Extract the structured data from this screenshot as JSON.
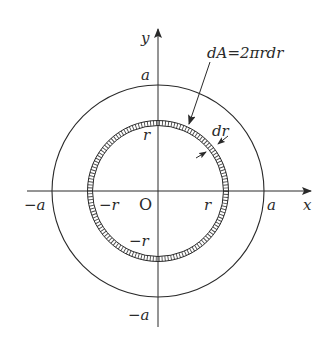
{
  "diagram": {
    "title": "",
    "type": "polar area element (thin annular ring) inside circle of radius a",
    "formula_label": "dA=2πrdr",
    "width_label": "dr",
    "axes": {
      "x_label": "x",
      "y_label": "y",
      "origin_label": "O"
    },
    "tick_labels": {
      "x_pos_a": "a",
      "x_neg_a": "−a",
      "x_pos_r": "r",
      "x_neg_r": "−r",
      "y_pos_a": "a",
      "y_neg_a": "−a",
      "y_pos_r": "r",
      "y_neg_r": "−r"
    },
    "shapes": {
      "outer_circle": {
        "label": "radius a"
      },
      "inner_ring": {
        "label": "annular strip of radius r and width dr"
      }
    },
    "colors": {
      "line": "#2a2a2a",
      "background": "#ffffff"
    }
  }
}
